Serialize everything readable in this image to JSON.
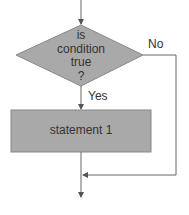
{
  "diagram": {
    "type": "flowchart-if",
    "decision": {
      "lines": [
        "is",
        "condition",
        "true",
        "?"
      ],
      "fill": "#a9a9a9"
    },
    "branch_yes": "Yes",
    "branch_no": "No",
    "process": {
      "label": "statement 1",
      "fill": "#a9a9a9"
    },
    "line_color": "#666666"
  }
}
